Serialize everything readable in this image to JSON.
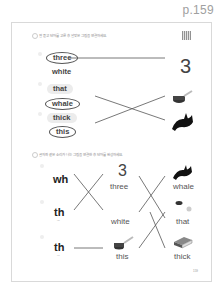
{
  "page_number": "p.159",
  "section1": {
    "instruction": "잘 듣고 단어를 고른 후 알맞은 그림을 연결하세요.",
    "rows": [
      {
        "options": [
          "three",
          "white"
        ],
        "selected": "three",
        "picture": "3"
      },
      {
        "options": [
          "that",
          "whale"
        ],
        "selected": "whale",
        "picture": "cup-icon"
      },
      {
        "options": [
          "thick",
          "this"
        ],
        "selected": "this",
        "picture": "whale-icon"
      }
    ]
  },
  "section2": {
    "instruction": "글자와 같은 소리가 나는 그림을 연결한 후 단어를 완성하세요.",
    "phonics": [
      {
        "letters": "wh",
        "hint": ""
      },
      {
        "letters": "th",
        "hint": "[ð]"
      },
      {
        "letters": "th",
        "hint": "[θ]"
      }
    ],
    "middle": [
      {
        "picture": "3",
        "word": "three"
      },
      {
        "picture": "",
        "word": "white"
      },
      {
        "picture": "cup-icon",
        "word": "this"
      }
    ],
    "right": [
      {
        "picture": "whale-icon",
        "word": "whale"
      },
      {
        "picture": "cup-icon",
        "word": "that"
      },
      {
        "picture": "book-icon",
        "word": "thick"
      }
    ]
  },
  "footer": {
    "page": "159"
  },
  "colors": {
    "line": "#555555",
    "border": "#d9d9d9",
    "page_number": "#a0a0a0"
  }
}
